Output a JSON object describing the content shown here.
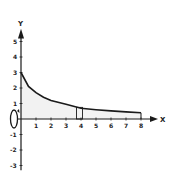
{
  "chart_data": {
    "type": "line",
    "title": "",
    "xlabel": "X",
    "ylabel": "Y",
    "xlim": [
      0,
      8.6
    ],
    "ylim": [
      -3.3,
      5.7
    ],
    "x_ticks": [
      "1",
      "2",
      "3",
      "4",
      "5",
      "6",
      "7",
      "8"
    ],
    "y_ticks": [
      "5",
      "4",
      "3",
      "2",
      "1",
      "-1",
      "-2",
      "-3"
    ],
    "grid": false,
    "series": [
      {
        "name": "curve",
        "x": [
          0,
          0.5,
          1,
          1.5,
          2,
          3,
          4,
          5,
          6,
          7,
          8
        ],
        "y": [
          3.0,
          2.1,
          1.7,
          1.4,
          1.2,
          0.95,
          0.7,
          0.6,
          0.52,
          0.46,
          0.4
        ]
      }
    ],
    "shaded_region": {
      "from_x": 0,
      "to_x": 8,
      "description": "region under curve, lightly shaded"
    },
    "representative_strip": {
      "x_left": 3.7,
      "x_right": 4.1,
      "height": 0.75
    },
    "right_edge_line_x": 8,
    "rotation_indicator": {
      "axis": "x-axis",
      "position_x": 0,
      "description": "ellipse with arrow around x-axis near origin indicating revolution about the x-axis"
    }
  },
  "colors": {
    "stroke": "#1a1a1a",
    "fill": "#f2f2f2",
    "background": "#ffffff"
  }
}
